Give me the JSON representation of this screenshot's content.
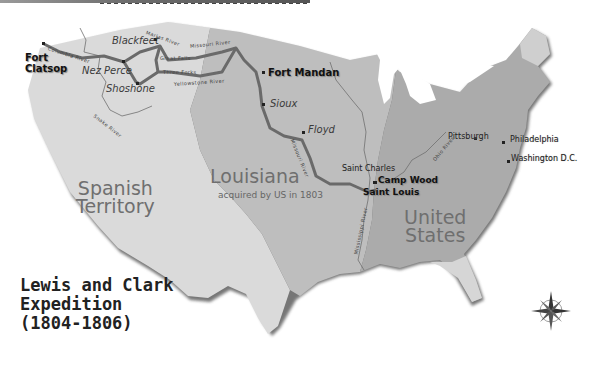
{
  "map": {
    "title_lines": [
      "Lewis and Clark",
      "Expedition",
      "(1804-1806)"
    ],
    "regions": {
      "spanish": {
        "line1": "Spanish",
        "line2": "Territory"
      },
      "louisiana": {
        "name": "Louisiana",
        "subtitle": "acquired by US in 1803"
      },
      "united_states": {
        "line1": "United",
        "line2": "States"
      }
    },
    "forts": [
      {
        "id": "fort-clatsop",
        "line1": "Fort",
        "line2": "Clatsop"
      },
      {
        "id": "fort-mandan",
        "label": "Fort Mandan"
      },
      {
        "id": "camp-wood",
        "label": "Camp Wood"
      },
      {
        "id": "saint-louis",
        "label": "Saint Louis"
      }
    ],
    "tribes": [
      "Blackfeet",
      "Nez Perce",
      "Shoshone",
      "Sioux",
      "Floyd"
    ],
    "cities": [
      "Saint Charles",
      "Pittsburgh",
      "Philadelphia",
      "Washington D.C."
    ],
    "rivers": [
      "Columbia River",
      "Marias River",
      "Missouri River",
      "Great Falls",
      "Three Forks",
      "Yellowstone River",
      "Snake River",
      "Missouri River",
      "Mississippi River",
      "Ohio River"
    ],
    "compass": {
      "label": "compass-rose",
      "points": [
        "N",
        "E",
        "S",
        "W"
      ]
    },
    "colors": {
      "spanish_fill": "#d8d8d8",
      "louisiana_fill": "#bdbdbd",
      "us_fill": "#a9a9a9",
      "route": "#6a6a6a",
      "coast_shadow": "#5a5a5a",
      "background": "#ffffff"
    }
  }
}
